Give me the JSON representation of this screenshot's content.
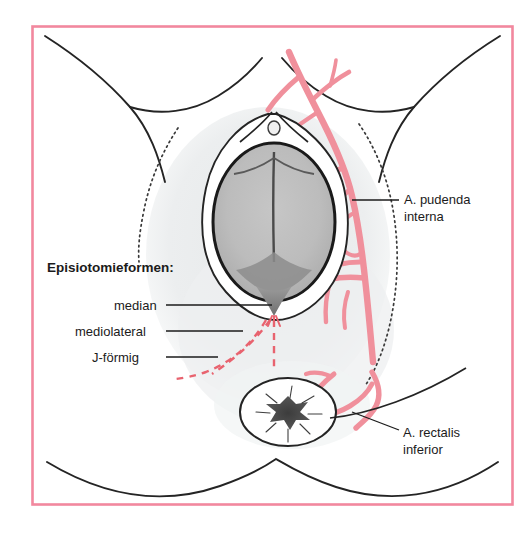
{
  "figure": {
    "kind": "medical-illustration",
    "language": "de",
    "frame": {
      "border_color": "#F2889E",
      "background_color": "#FFFFFF",
      "x": 31,
      "y": 25,
      "width": 482,
      "height": 480
    },
    "palette": {
      "artery": "#F0909C",
      "artery_outline": "#E2707F",
      "incision_dashed": "#E8636F",
      "outline": "#1F1F1F",
      "skin_shading": "#ECEEEF",
      "fetal_head_fill": "#B9B9B9",
      "fetal_head_shadow": "#8F8F8F",
      "anus_center": "#4A4A4A",
      "text": "#1B1B1B"
    }
  },
  "labels": {
    "heading": "Episiotomieformen:",
    "episiotomy_types": [
      {
        "name": "median",
        "label": "median"
      },
      {
        "name": "mediolateral",
        "label": "mediolateral"
      },
      {
        "name": "j-foermig",
        "label": "J-förmig"
      }
    ],
    "arteries": [
      {
        "name": "a-pudenda-interna",
        "line1": "A. pudenda",
        "line2": "interna"
      },
      {
        "name": "a-rectalis-inferior",
        "line1": "A. rectalis",
        "line2": "inferior"
      }
    ]
  },
  "anatomy": {
    "structures": [
      "thigh-outline-left",
      "thigh-outline-right",
      "labia-majora",
      "vaginal-introitus",
      "fetal-head",
      "sagittal-suture",
      "posterior-fourchette",
      "perineum",
      "anus",
      "buttock-crease",
      "ischial-landmark-dotted-left",
      "ischial-landmark-dotted-right"
    ]
  }
}
